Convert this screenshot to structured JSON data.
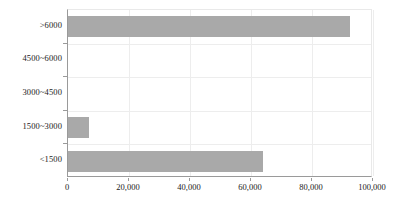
{
  "chart_data": {
    "type": "bar",
    "orientation": "horizontal",
    "title": "",
    "subtitle": "",
    "xlabel": "",
    "ylabel": "",
    "categories": [
      ">6000",
      "4500~6000",
      "3000~4500",
      "1500~3000",
      "<1500"
    ],
    "values": [
      92500,
      0,
      0,
      6900,
      64000
    ],
    "series": [
      {
        "name": "",
        "values": [
          92500,
          0,
          0,
          6900,
          64000
        ]
      }
    ],
    "xlim": [
      0,
      100000
    ],
    "xticks": [
      0,
      20000,
      40000,
      60000,
      80000,
      100000
    ],
    "xtick_labels": [
      "0",
      "20,000",
      "40,000",
      "60,000",
      "80,000",
      "100,000"
    ],
    "grid": true,
    "legend": false,
    "legend_position": "none",
    "bar_color": "#a9a9a9",
    "background_color": "#ffffff",
    "axis_color": "#9a9a9a",
    "gridline_color": "#ededed"
  }
}
